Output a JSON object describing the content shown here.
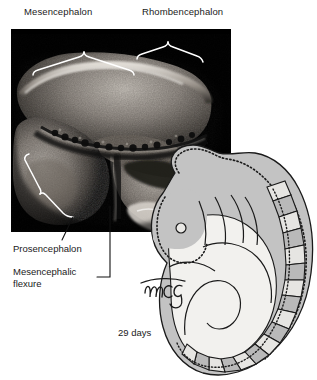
{
  "figure": {
    "caption_days": "29 days",
    "signature": "mcg"
  },
  "labels": {
    "top": [
      {
        "id": "mesencephalon",
        "text": "Mesencephalon"
      },
      {
        "id": "rhombencephalon",
        "text": "Rhombencephalon"
      }
    ],
    "left": [
      {
        "id": "prosencephalon",
        "text": "Prosencephalon"
      },
      {
        "id": "mesencephalic_flexure_line1",
        "text": "Mesencephalic"
      },
      {
        "id": "mesencephalic_flexure_line2",
        "text": "flexure"
      }
    ]
  },
  "colors": {
    "photo_background": "#000000",
    "page_background": "#ffffff",
    "text": "#1a1a1a",
    "bracket_white": "#ffffff",
    "leader_black": "#111111",
    "embryo_body_gray": "#c3c3c3",
    "embryo_light": "#f2f1ee",
    "somite_gray": "#b9b9b9",
    "somite_light": "#e6e5e2",
    "outline": "#1a1a1a"
  },
  "panels": {
    "photomicrograph": {
      "name": "histological-section",
      "description": "sagittal section of embryonic brain"
    },
    "embryo_diagram": {
      "name": "embryo-orientation-diagram",
      "description": "lateral view of 29-day embryo with somites"
    }
  }
}
